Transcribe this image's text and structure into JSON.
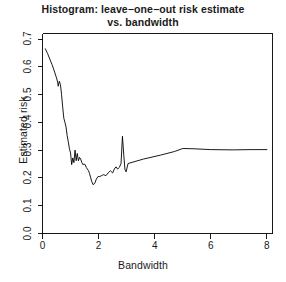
{
  "chart_data": {
    "type": "line",
    "title": "Histogram: leave−one−out risk estimate vs. bandwidth",
    "title_line1": "Histogram: leave−one−out risk estimate",
    "title_line2": "vs. bandwidth",
    "xlabel": "Bandwidth",
    "ylabel": "Estimated risk",
    "xlim": [
      0,
      8.2
    ],
    "ylim": [
      0.0,
      0.72
    ],
    "xticks": [
      "0",
      "2",
      "4",
      "6",
      "8"
    ],
    "xtick_values": [
      0,
      2,
      4,
      6,
      8
    ],
    "yticks": [
      "0.0",
      "0.1",
      "0.2",
      "0.3",
      "0.4",
      "0.5",
      "0.6",
      "0.7"
    ],
    "ytick_values": [
      0.0,
      0.1,
      0.2,
      0.3,
      0.4,
      0.5,
      0.6,
      0.7
    ],
    "grid": false,
    "legend": null,
    "line_color": "#000000",
    "line_width": 0.9,
    "series": [
      {
        "name": "leave-one-out risk estimate",
        "x": [
          0.1,
          0.18,
          0.26,
          0.34,
          0.42,
          0.5,
          0.54,
          0.56,
          0.6,
          0.64,
          0.68,
          0.72,
          0.76,
          0.8,
          0.84,
          0.88,
          0.92,
          0.96,
          1.0,
          1.04,
          1.08,
          1.12,
          1.16,
          1.2,
          1.24,
          1.28,
          1.32,
          1.36,
          1.4,
          1.44,
          1.48,
          1.52,
          1.56,
          1.6,
          1.64,
          1.68,
          1.72,
          1.76,
          1.8,
          1.86,
          1.92,
          1.98,
          2.04,
          2.1,
          2.18,
          2.26,
          2.34,
          2.42,
          2.5,
          2.56,
          2.62,
          2.68,
          2.74,
          2.8,
          2.85,
          2.9,
          2.94,
          2.98,
          3.05,
          3.6,
          4.2,
          4.7,
          5.0,
          5.4,
          6.0,
          6.8,
          7.4,
          8.0
        ],
        "y": [
          0.665,
          0.648,
          0.628,
          0.608,
          0.585,
          0.56,
          0.545,
          0.53,
          0.548,
          0.536,
          0.5,
          0.455,
          0.415,
          0.4,
          0.383,
          0.352,
          0.33,
          0.305,
          0.29,
          0.248,
          0.272,
          0.255,
          0.3,
          0.262,
          0.288,
          0.262,
          0.274,
          0.268,
          0.256,
          0.248,
          0.25,
          0.248,
          0.238,
          0.232,
          0.226,
          0.215,
          0.2,
          0.186,
          0.176,
          0.18,
          0.196,
          0.205,
          0.205,
          0.208,
          0.212,
          0.208,
          0.218,
          0.226,
          0.218,
          0.232,
          0.24,
          0.232,
          0.238,
          0.252,
          0.35,
          0.28,
          0.23,
          0.222,
          0.252,
          0.268,
          0.282,
          0.295,
          0.306,
          0.305,
          0.302,
          0.301,
          0.302,
          0.302
        ],
        "notable_points": {
          "start": {
            "x": 0.1,
            "y": 0.665
          },
          "minimum": {
            "x": 1.8,
            "y": 0.176
          },
          "spike_peak": {
            "x": 2.85,
            "y": 0.35
          },
          "plateau_level": 0.302,
          "end": {
            "x": 8.0,
            "y": 0.302
          }
        }
      }
    ]
  }
}
